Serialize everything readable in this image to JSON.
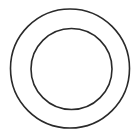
{
  "diagram": {
    "type": "concentric-circles",
    "background": "#ffffff",
    "stroke_color": "#2a2a2a",
    "shapes": [
      {
        "name": "outer-circle",
        "cx": 70,
        "cy": 68.5,
        "r": 59.5,
        "stroke_width": 1.6
      },
      {
        "name": "inner-circle",
        "cx": 71.5,
        "cy": 69,
        "r": 40.5,
        "stroke_width": 1.6
      }
    ]
  }
}
